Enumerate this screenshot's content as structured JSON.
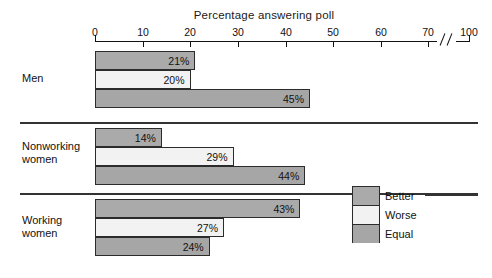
{
  "chart_data": {
    "type": "bar",
    "orientation": "horizontal",
    "title": "Percentage answering poll",
    "xlabel": "",
    "ylabel": "",
    "xlim": [
      0,
      100
    ],
    "grid": false,
    "axis_break": {
      "after": 70,
      "before": 100,
      "symbol": "//"
    },
    "tick_labels": [
      "0",
      "10",
      "20",
      "30",
      "40",
      "50",
      "60",
      "70",
      "100"
    ],
    "tick_values": [
      0,
      10,
      20,
      30,
      40,
      50,
      60,
      70,
      100
    ],
    "categories": [
      "Men",
      "Nonworking\nwomen",
      "Working\nwomen"
    ],
    "legend_position": "bottom-right",
    "series": [
      {
        "name": "Better",
        "values": [
          21,
          14,
          43
        ],
        "color": "#aaaaaa"
      },
      {
        "name": "Worse",
        "values": [
          20,
          29,
          27
        ],
        "color": "#f2f2f2"
      },
      {
        "name": "Equal",
        "values": [
          45,
          44,
          24
        ],
        "color": "#a6a6a6"
      }
    ],
    "groups": [
      {
        "label": "Men",
        "bars": [
          {
            "series": "Better",
            "value": 21,
            "value_label": "21%"
          },
          {
            "series": "Worse",
            "value": 20,
            "value_label": "20%"
          },
          {
            "series": "Equal",
            "value": 45,
            "value_label": "45%"
          }
        ]
      },
      {
        "label": "Nonworking\nwomen",
        "bars": [
          {
            "series": "Better",
            "value": 14,
            "value_label": "14%"
          },
          {
            "series": "Worse",
            "value": 29,
            "value_label": "29%"
          },
          {
            "series": "Equal",
            "value": 44,
            "value_label": "44%"
          }
        ]
      },
      {
        "label": "Working\nwomen",
        "bars": [
          {
            "series": "Better",
            "value": 43,
            "value_label": "43%"
          },
          {
            "series": "Worse",
            "value": 27,
            "value_label": "27%"
          },
          {
            "series": "Equal",
            "value": 24,
            "value_label": "24%"
          }
        ]
      }
    ]
  },
  "axis": {
    "ticks": [
      {
        "label": "0",
        "x": 95
      },
      {
        "label": "10",
        "x": 143
      },
      {
        "label": "20",
        "x": 190
      },
      {
        "label": "30",
        "x": 238
      },
      {
        "label": "40",
        "x": 286
      },
      {
        "label": "50",
        "x": 333
      },
      {
        "label": "60",
        "x": 381
      },
      {
        "label": "70",
        "x": 428
      },
      {
        "label": "100",
        "x": 469
      }
    ]
  },
  "legend": {
    "entries": [
      {
        "label": "Better",
        "color": "#aaaaaa"
      },
      {
        "label": "Worse",
        "color": "#f2f2f2"
      },
      {
        "label": "Equal",
        "color": "#a6a6a6"
      }
    ]
  },
  "colors": {
    "better": "#aaaaaa",
    "worse": "#f2f2f2",
    "equal": "#a6a6a6",
    "outline": "#2b2b2b",
    "rule": "#333333",
    "background": "#ffffff",
    "text": "#111111"
  }
}
